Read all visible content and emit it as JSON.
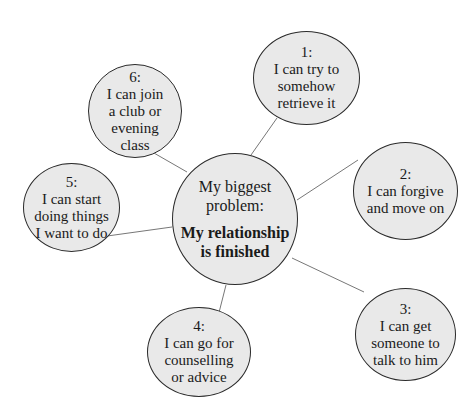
{
  "diagram": {
    "type": "spider-diagram",
    "center": {
      "title": "My biggest\nproblem:",
      "main": "My relationship\nis finished"
    },
    "options": [
      {
        "number": "1:",
        "text": "I can try to\nsomehow\nretrieve it"
      },
      {
        "number": "2:",
        "text": "I can forgive\nand move on"
      },
      {
        "number": "3:",
        "text": "I can get\nsomeone to\ntalk to him"
      },
      {
        "number": "4:",
        "text": "I can go for\ncounselling\nor advice"
      },
      {
        "number": "5:",
        "text": "I can start\ndoing things\nI want to do"
      },
      {
        "number": "6:",
        "text": "I can join\na club or\nevening\nclass"
      }
    ],
    "colors": {
      "bubble_fill": "#e9e9e9",
      "bubble_border": "#2a2a2a",
      "connector": "#777777"
    }
  }
}
